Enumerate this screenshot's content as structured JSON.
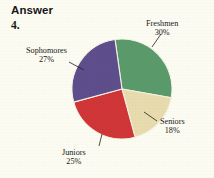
{
  "page": {
    "background_color": "#fdfcf2",
    "answer_heading": "Answer",
    "problem_number": "4."
  },
  "chart_data": {
    "type": "pie",
    "title": "",
    "subtitle": "",
    "xlabel": "",
    "ylabel": "",
    "legend_position": "none",
    "grid": false,
    "labels_shown_as": "callout-labels-with-leader-lines",
    "categories": [
      "Freshmen",
      "Seniors",
      "Juniors",
      "Sophomores"
    ],
    "values": [
      30,
      18,
      25,
      27
    ],
    "value_unit": "%",
    "start_angle_deg": -8,
    "colors": [
      "#5a9a6a",
      "#e8dcae",
      "#d03537",
      "#5d4e8c"
    ],
    "slices": [
      {
        "name": "Freshmen",
        "value": 30,
        "value_label": "30%",
        "color": "#5a9a6a",
        "position": "top-right"
      },
      {
        "name": "Seniors",
        "value": 18,
        "value_label": "18%",
        "color": "#e8dcae",
        "position": "right-bottom"
      },
      {
        "name": "Juniors",
        "value": 25,
        "value_label": "25%",
        "color": "#d03537",
        "position": "bottom-left"
      },
      {
        "name": "Sophomores",
        "value": 27,
        "value_label": "27%",
        "color": "#5d4e8c",
        "position": "top-left"
      }
    ]
  },
  "labels": {
    "freshmen": {
      "name": "Freshmen",
      "pct": "30%"
    },
    "sophomores": {
      "name": "Sophomores",
      "pct": "27%"
    },
    "seniors": {
      "name": "Seniors",
      "pct": "18%"
    },
    "juniors": {
      "name": "Juniors",
      "pct": "25%"
    }
  }
}
